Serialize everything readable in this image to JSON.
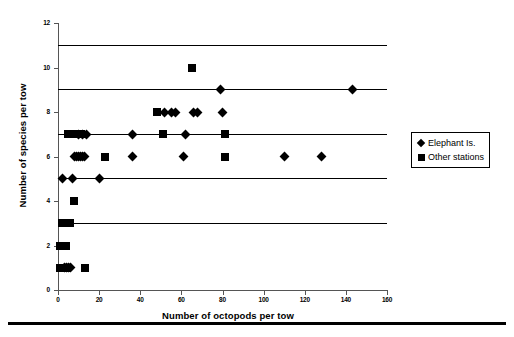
{
  "chart_data": {
    "type": "scatter",
    "title": "",
    "xlabel": "Number of octopods per tow",
    "ylabel": "Number of species per tow",
    "xlim": [
      0,
      160
    ],
    "ylim": [
      0,
      12
    ],
    "xticks": [
      0,
      20,
      40,
      60,
      80,
      100,
      120,
      140,
      160
    ],
    "yticks": [
      0,
      2,
      4,
      6,
      8,
      10,
      12
    ],
    "grid": "horizontal-gridlines-at-2-4-6-8-10",
    "legend_position": "right-middle",
    "marker_color": "#000000",
    "series": [
      {
        "name": "Elephant Is.",
        "marker": "diamond",
        "points": [
          [
            2,
            5
          ],
          [
            3,
            1
          ],
          [
            4,
            1
          ],
          [
            5,
            1
          ],
          [
            6,
            1
          ],
          [
            7,
            5
          ],
          [
            8,
            6
          ],
          [
            9,
            6
          ],
          [
            10,
            6
          ],
          [
            11,
            6
          ],
          [
            12,
            6
          ],
          [
            13,
            6
          ],
          [
            10,
            7
          ],
          [
            12,
            7
          ],
          [
            14,
            7
          ],
          [
            20,
            5
          ],
          [
            36,
            6
          ],
          [
            36,
            7
          ],
          [
            52,
            8
          ],
          [
            55,
            8
          ],
          [
            57,
            8
          ],
          [
            61,
            6
          ],
          [
            62,
            7
          ],
          [
            66,
            8
          ],
          [
            68,
            8
          ],
          [
            79,
            9
          ],
          [
            80,
            8
          ],
          [
            110,
            6
          ],
          [
            128,
            6
          ],
          [
            143,
            9
          ]
        ]
      },
      {
        "name": "Other stations",
        "marker": "square",
        "points": [
          [
            1,
            1
          ],
          [
            2,
            1
          ],
          [
            3,
            1
          ],
          [
            4,
            1
          ],
          [
            1,
            2
          ],
          [
            2,
            2
          ],
          [
            3,
            2
          ],
          [
            4,
            2
          ],
          [
            2,
            3
          ],
          [
            3,
            3
          ],
          [
            4,
            3
          ],
          [
            5,
            3
          ],
          [
            6,
            3
          ],
          [
            8,
            4
          ],
          [
            5,
            7
          ],
          [
            8,
            7
          ],
          [
            9,
            7
          ],
          [
            10,
            7
          ],
          [
            11,
            7
          ],
          [
            13,
            1
          ],
          [
            23,
            6
          ],
          [
            48,
            8
          ],
          [
            51,
            7
          ],
          [
            65,
            10
          ],
          [
            81,
            6
          ],
          [
            81,
            7
          ]
        ]
      }
    ]
  },
  "legend": {
    "items": [
      {
        "label": "Elephant Is.",
        "marker": "diamond"
      },
      {
        "label": "Other stations",
        "marker": "square"
      }
    ]
  }
}
